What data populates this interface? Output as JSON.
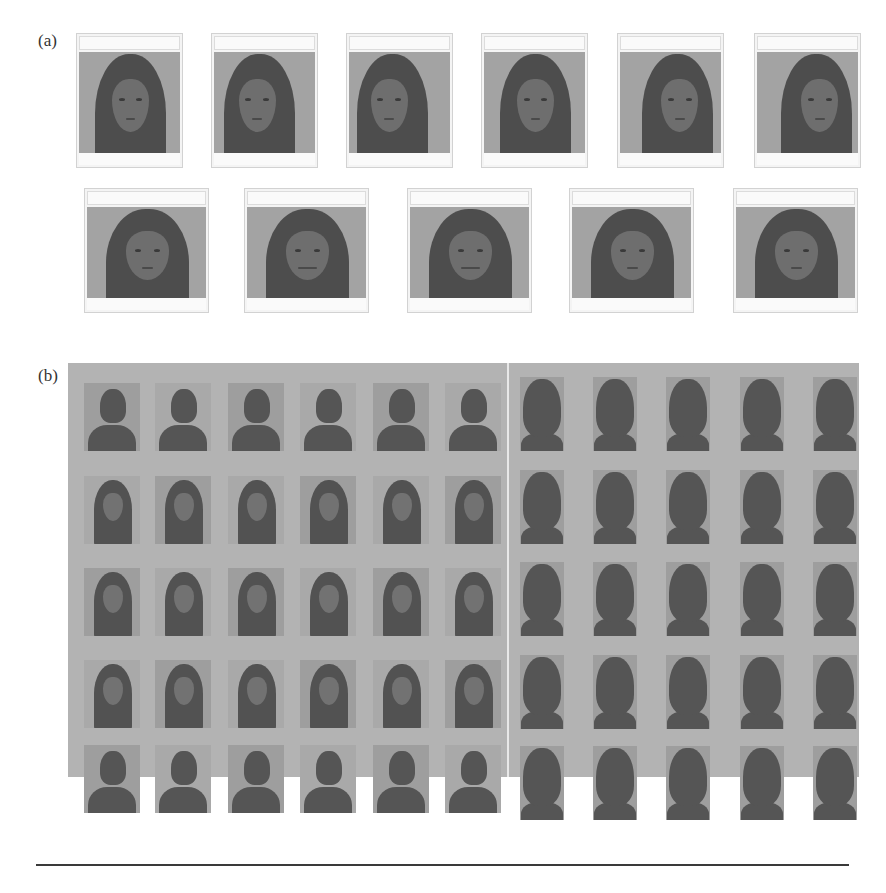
{
  "figure": {
    "panel_a": {
      "label": "(a)",
      "description": "Eleven webcam capture windows of one female subject with varying head pose and expression",
      "rows": [
        {
          "count": 6,
          "poses": [
            "frontal",
            "turned-right",
            "turned-left",
            "looking-up",
            "looking-up-left",
            "tilted-left"
          ]
        },
        {
          "count": 5,
          "poses": [
            "looking-down",
            "smiling",
            "smiling-wide",
            "frontal-neutral",
            "frontal-slight-smile"
          ]
        }
      ]
    },
    "panel_b": {
      "label": "(b)",
      "description": "Grid of face image thumbnails from a database, left block female subjects, right block male subjects",
      "left_block": {
        "subject": "female",
        "rows": 5,
        "cols": 6
      },
      "right_block": {
        "subject": "male",
        "rows": 5,
        "cols": 5
      }
    }
  },
  "colors": {
    "page_background": "#ffffff",
    "panel_b_background": "#b3b3b3",
    "photo_background": "#a3a3a3",
    "rule": "#3a3a3a"
  }
}
